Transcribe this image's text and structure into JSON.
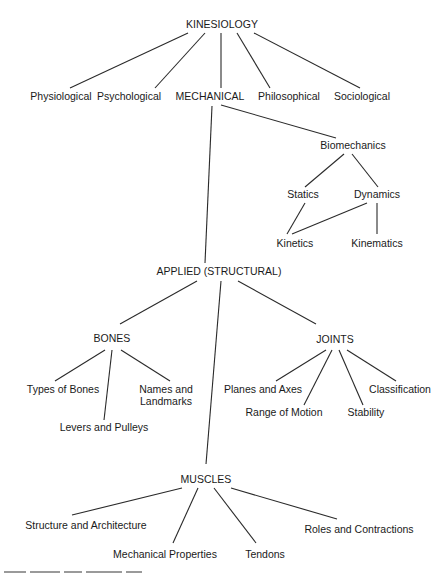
{
  "diagram": {
    "title": "KINESIOLOGY",
    "nodes": [
      {
        "id": "kinesiology",
        "label": "KINESIOLOGY"
      },
      {
        "id": "physiological",
        "label": "Physiological"
      },
      {
        "id": "psychological",
        "label": "Psychological"
      },
      {
        "id": "mechanical",
        "label": "MECHANICAL"
      },
      {
        "id": "philosophical",
        "label": "Philosophical"
      },
      {
        "id": "sociological",
        "label": "Sociological"
      },
      {
        "id": "biomechanics",
        "label": "Biomechanics"
      },
      {
        "id": "statics",
        "label": "Statics"
      },
      {
        "id": "dynamics",
        "label": "Dynamics"
      },
      {
        "id": "kinetics",
        "label": "Kinetics"
      },
      {
        "id": "kinematics",
        "label": "Kinematics"
      },
      {
        "id": "applied",
        "label": "APPLIED (STRUCTURAL)"
      },
      {
        "id": "bones",
        "label": "BONES"
      },
      {
        "id": "joints",
        "label": "JOINTS"
      },
      {
        "id": "types_of_bones",
        "label": "Types of Bones"
      },
      {
        "id": "names_landmarks_1",
        "label": "Names and"
      },
      {
        "id": "names_landmarks_2",
        "label": "Landmarks"
      },
      {
        "id": "levers_pulleys",
        "label": "Levers and Pulleys"
      },
      {
        "id": "planes_axes",
        "label": "Planes and Axes"
      },
      {
        "id": "range_of_motion",
        "label": "Range of Motion"
      },
      {
        "id": "stability",
        "label": "Stability"
      },
      {
        "id": "classification",
        "label": "Classification"
      },
      {
        "id": "muscles",
        "label": "MUSCLES"
      },
      {
        "id": "structure_architecture",
        "label": "Structure and Architecture"
      },
      {
        "id": "mechanical_properties",
        "label": "Mechanical Properties"
      },
      {
        "id": "tendons",
        "label": "Tendons"
      },
      {
        "id": "roles_contractions",
        "label": "Roles and Contractions"
      }
    ],
    "edges": [
      [
        "kinesiology",
        "physiological"
      ],
      [
        "kinesiology",
        "psychological"
      ],
      [
        "kinesiology",
        "mechanical"
      ],
      [
        "kinesiology",
        "philosophical"
      ],
      [
        "kinesiology",
        "sociological"
      ],
      [
        "mechanical",
        "biomechanics"
      ],
      [
        "mechanical",
        "applied"
      ],
      [
        "biomechanics",
        "statics"
      ],
      [
        "biomechanics",
        "dynamics"
      ],
      [
        "statics",
        "kinetics"
      ],
      [
        "dynamics",
        "kinetics"
      ],
      [
        "dynamics",
        "kinematics"
      ],
      [
        "applied",
        "bones"
      ],
      [
        "applied",
        "joints"
      ],
      [
        "applied",
        "muscles"
      ],
      [
        "bones",
        "types_of_bones"
      ],
      [
        "bones",
        "levers_pulleys"
      ],
      [
        "bones",
        "names_landmarks"
      ],
      [
        "joints",
        "planes_axes"
      ],
      [
        "joints",
        "range_of_motion"
      ],
      [
        "joints",
        "stability"
      ],
      [
        "joints",
        "classification"
      ],
      [
        "muscles",
        "structure_architecture"
      ],
      [
        "muscles",
        "mechanical_properties"
      ],
      [
        "muscles",
        "tendons"
      ],
      [
        "muscles",
        "roles_contractions"
      ]
    ]
  }
}
